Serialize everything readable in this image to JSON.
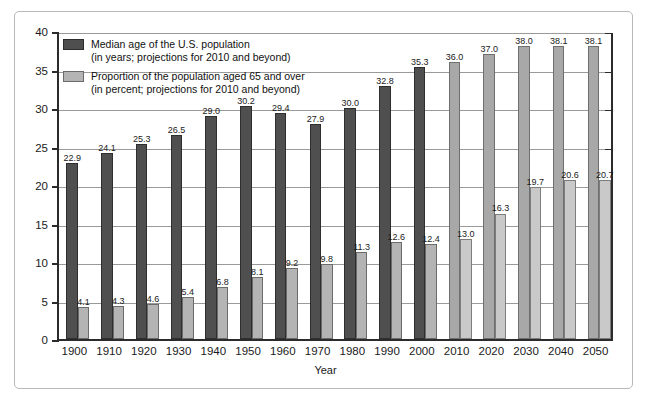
{
  "chart_data": {
    "type": "bar",
    "title": "",
    "xlabel": "Year",
    "ylabel": "",
    "ylim": [
      0,
      40
    ],
    "yticks": [
      "0",
      "5",
      "10",
      "15",
      "20",
      "25",
      "30",
      "35",
      "40"
    ],
    "grid": true,
    "legend_position": "top-left",
    "categories": [
      "1900",
      "1910",
      "1920",
      "1930",
      "1940",
      "1950",
      "1960",
      "1970",
      "1980",
      "1990",
      "2000",
      "2010",
      "2020",
      "2030",
      "2040",
      "2050"
    ],
    "projected_from": "2010",
    "series": [
      {
        "name": "Median age of the U.S. population",
        "unit": "years",
        "color": "#4f4f4f",
        "projected_color": "#a8a8a8",
        "values": [
          22.9,
          24.1,
          25.3,
          26.5,
          29.0,
          30.2,
          29.4,
          27.9,
          30.0,
          32.8,
          35.3,
          36.0,
          37.0,
          38.0,
          38.1,
          38.1
        ],
        "labels": [
          "22.9",
          "24.1",
          "25.3",
          "26.5",
          "29.0",
          "30.2",
          "29.4",
          "27.9",
          "30.0",
          "32.8",
          "35.3",
          "36.0",
          "37.0",
          "38.0",
          "38.1",
          "38.1"
        ]
      },
      {
        "name": "Proportion of the population aged 65 and over",
        "unit": "percent",
        "color": "#b4b4b4",
        "projected_color": "#c9c9c9",
        "values": [
          4.1,
          4.3,
          4.6,
          5.4,
          6.8,
          8.1,
          9.2,
          9.8,
          11.3,
          12.6,
          12.4,
          13.0,
          16.3,
          19.7,
          20.6,
          20.7
        ],
        "labels": [
          "4.1",
          "4.3",
          "4.6",
          "5.4",
          "6.8",
          "8.1",
          "9.2",
          "9.8",
          "11.3",
          "12.6",
          "12.4",
          "13.0",
          "16.3",
          "19.7",
          "20.6",
          "20.7"
        ]
      }
    ]
  },
  "legend": {
    "items": [
      {
        "line1": "Median age of the U.S. population",
        "line2": "(in years; projections for 2010 and beyond)",
        "swatch": "dark"
      },
      {
        "line1": "Proportion of the population aged 65 and over",
        "line2": "(in percent; projections for 2010 and beyond)",
        "swatch": "light"
      }
    ]
  },
  "axes": {
    "x_title": "Year"
  }
}
